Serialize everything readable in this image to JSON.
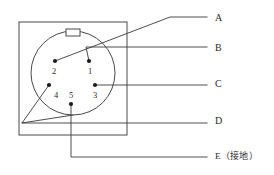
{
  "diagram": {
    "colors": {
      "line": "#3a3a3a",
      "outline": "#4a4a4a",
      "pin": "#1c1c1c",
      "text": "#2b2b2b",
      "background": "#ffffff"
    },
    "plate": {
      "x": 19,
      "y": 22,
      "width": 108,
      "height": 113
    },
    "body_circle": {
      "cx": 73,
      "cy": 73,
      "r": 42
    },
    "keyway": {
      "x": 66,
      "y": 29,
      "width": 14,
      "height": 7
    },
    "pins": [
      {
        "id": "pin-1",
        "label": "1",
        "dot_x": 89,
        "dot_y": 61,
        "label_x": 90,
        "label_y": 74
      },
      {
        "id": "pin-2",
        "label": "2",
        "dot_x": 55,
        "dot_y": 61,
        "label_x": 54,
        "label_y": 74
      },
      {
        "id": "pin-3",
        "label": "3",
        "dot_x": 95,
        "dot_y": 85,
        "label_x": 95,
        "label_y": 98
      },
      {
        "id": "pin-4",
        "label": "4",
        "dot_x": 49,
        "dot_y": 85,
        "label_x": 56,
        "label_y": 98
      },
      {
        "id": "pin-5",
        "label": "5",
        "dot_x": 71,
        "dot_y": 104,
        "label_x": 71,
        "label_y": 98
      }
    ],
    "callouts": [
      {
        "id": "callout-a",
        "label": "A",
        "label_x": 215,
        "label_y": 19,
        "leader": "M 55 61 L 170 17 L 207 17",
        "source_pin": "2"
      },
      {
        "id": "callout-b",
        "label": "B",
        "label_x": 215,
        "label_y": 49,
        "leader": "M 89 61 L 86 47 L 207 47",
        "source_pin": "1"
      },
      {
        "id": "callout-c",
        "label": "C",
        "label_x": 215,
        "label_y": 85,
        "leader": "M 95 85 L 207 85",
        "source_pin": "3"
      },
      {
        "id": "callout-d",
        "label": "D",
        "label_x": 215,
        "label_y": 122,
        "leader": "M 49 85 L 22 123 L 207 123",
        "source_pin": "4"
      },
      {
        "id": "callout-e",
        "label": "E（接地）",
        "label_x": 215,
        "label_y": 157,
        "leader": "M 71 104 L 71 157 L 207 157",
        "source_pin": "5"
      }
    ],
    "extra_leader": {
      "id": "callout-d-second-branch",
      "path": "M 73 115 L 22 123"
    }
  }
}
